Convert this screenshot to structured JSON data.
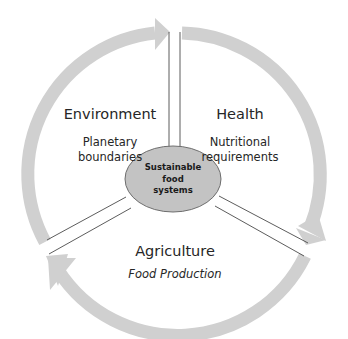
{
  "diagram": {
    "center": {
      "label_lines": [
        "Sustainable",
        "food",
        "systems"
      ],
      "fill": "#c3c3c3",
      "stroke": "#6e6e6e"
    },
    "sections": [
      {
        "title": "Environment",
        "subtitle_lines": [
          "Planetary",
          "boundaries"
        ],
        "italic": false
      },
      {
        "title": "Health",
        "subtitle_lines": [
          "Nutritional",
          "requirements"
        ],
        "italic": false
      },
      {
        "title": "Agriculture",
        "subtitle_lines": [
          "Food Production"
        ],
        "italic": true
      }
    ],
    "arrow_color": "#d0d0d0",
    "divider_color": "#4a4a4a",
    "text_color": "#262626"
  }
}
